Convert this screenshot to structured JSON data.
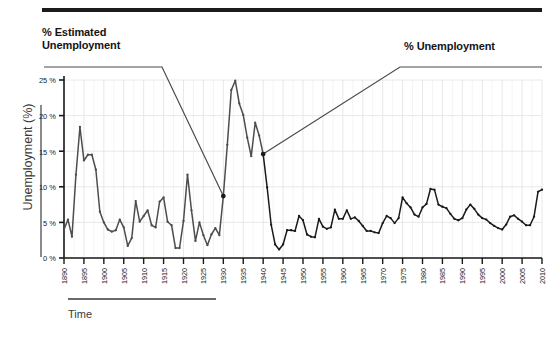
{
  "figure": {
    "annotation_left": "% Estimated\nUnemployment",
    "annotation_right": "% Unemployment",
    "top_rule_color": "#1b1b1b"
  },
  "chart_data": {
    "type": "line",
    "title": "",
    "subtitle": "",
    "xlabel": "Time",
    "ylabel": "Unemployment (%)",
    "xlim": [
      1890,
      2010
    ],
    "ylim": [
      0,
      25
    ],
    "grid": true,
    "legend_position": "annotations",
    "line_color": "#4d4d4d",
    "line_color_late": "#1a1a1a",
    "marker": "dot",
    "annotations": [
      {
        "label": "% Estimated Unemployment",
        "points_to_year": 1930,
        "points_to_value": 8.7
      },
      {
        "label": "% Unemployment",
        "points_to_year": 1940,
        "points_to_value": 14.6
      }
    ],
    "xticks": [
      1890,
      1895,
      1900,
      1905,
      1910,
      1915,
      1920,
      1925,
      1930,
      1935,
      1940,
      1945,
      1950,
      1955,
      1960,
      1965,
      1970,
      1975,
      1980,
      1985,
      1990,
      1995,
      2000,
      2005,
      2010
    ],
    "xticklabels": [
      "1890",
      "1895",
      "1900",
      "1905",
      "1910",
      "1915",
      "1920",
      "1925",
      "1930",
      "1935",
      "1940",
      "1945",
      "1950",
      "1955",
      "1960",
      "1965",
      "1970",
      "1975",
      "1980",
      "1985",
      "1990",
      "1995",
      "2000",
      "2005",
      "2010"
    ],
    "yticks": [
      0,
      5,
      10,
      15,
      20,
      25
    ],
    "yticklabels": [
      "0 %",
      "5 %",
      "10 %",
      "15 %",
      "20 %",
      "25 %"
    ],
    "series": [
      {
        "name": "% Estimated Unemployment",
        "x": [
          1890,
          1891,
          1892,
          1893,
          1894,
          1895,
          1896,
          1897,
          1898,
          1899,
          1900,
          1901,
          1902,
          1903,
          1904,
          1905,
          1906,
          1907,
          1908,
          1909,
          1910,
          1911,
          1912,
          1913,
          1914,
          1915,
          1916,
          1917,
          1918,
          1919,
          1920,
          1921,
          1922,
          1923,
          1924,
          1925,
          1926,
          1927,
          1928,
          1929,
          1930,
          1931,
          1932,
          1933,
          1934,
          1935,
          1936,
          1937,
          1938,
          1939,
          1940
        ],
        "values": [
          4.0,
          5.4,
          3.0,
          11.7,
          18.4,
          13.7,
          14.5,
          14.5,
          12.4,
          6.5,
          5.0,
          4.0,
          3.7,
          3.9,
          5.4,
          4.3,
          1.7,
          2.8,
          8.0,
          5.1,
          5.9,
          6.7,
          4.6,
          4.3,
          7.9,
          8.5,
          5.1,
          4.6,
          1.4,
          1.4,
          5.2,
          11.7,
          6.7,
          2.4,
          5.0,
          3.2,
          1.8,
          3.3,
          4.2,
          3.2,
          8.7,
          15.9,
          23.6,
          24.9,
          21.7,
          20.1,
          16.9,
          14.3,
          19.0,
          17.2,
          14.6
        ]
      },
      {
        "name": "% Unemployment",
        "x": [
          1940,
          1941,
          1942,
          1943,
          1944,
          1945,
          1946,
          1947,
          1948,
          1949,
          1950,
          1951,
          1952,
          1953,
          1954,
          1955,
          1956,
          1957,
          1958,
          1959,
          1960,
          1961,
          1962,
          1963,
          1964,
          1965,
          1966,
          1967,
          1968,
          1969,
          1970,
          1971,
          1972,
          1973,
          1974,
          1975,
          1976,
          1977,
          1978,
          1979,
          1980,
          1981,
          1982,
          1983,
          1984,
          1985,
          1986,
          1987,
          1988,
          1989,
          1990,
          1991,
          1992,
          1993,
          1994,
          1995,
          1996,
          1997,
          1998,
          1999,
          2000,
          2001,
          2002,
          2003,
          2004,
          2005,
          2006,
          2007,
          2008,
          2009,
          2010
        ],
        "values": [
          14.6,
          9.9,
          4.7,
          1.9,
          1.2,
          1.9,
          3.9,
          3.9,
          3.8,
          5.9,
          5.3,
          3.3,
          3.0,
          2.9,
          5.5,
          4.4,
          4.1,
          4.3,
          6.8,
          5.5,
          5.5,
          6.7,
          5.5,
          5.7,
          5.2,
          4.5,
          3.8,
          3.8,
          3.6,
          3.5,
          4.9,
          5.9,
          5.6,
          4.9,
          5.6,
          8.5,
          7.7,
          7.1,
          6.1,
          5.8,
          7.1,
          7.6,
          9.7,
          9.6,
          7.5,
          7.2,
          7.0,
          6.2,
          5.5,
          5.3,
          5.6,
          6.8,
          7.5,
          6.9,
          6.1,
          5.6,
          5.4,
          4.9,
          4.5,
          4.2,
          4.0,
          4.7,
          5.8,
          6.0,
          5.5,
          5.1,
          4.6,
          4.6,
          5.8,
          9.3,
          9.6
        ]
      }
    ]
  }
}
